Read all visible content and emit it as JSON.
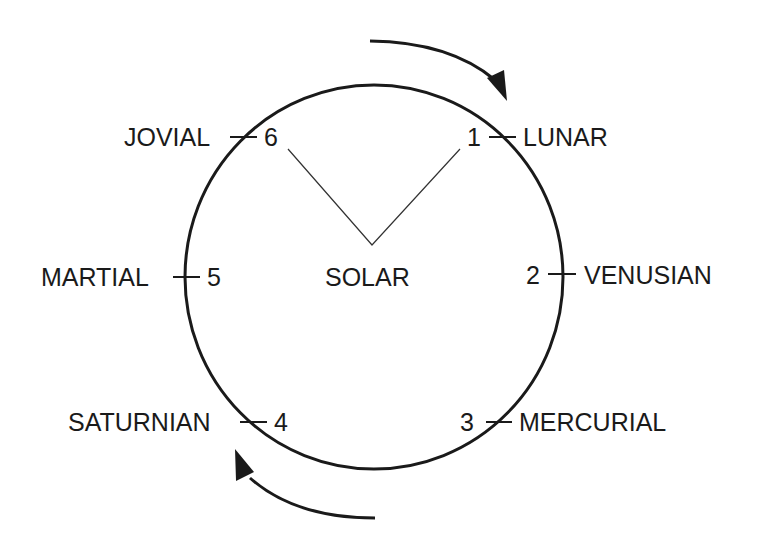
{
  "diagram": {
    "type": "planetary-cycle-circle",
    "center_label": "SOLAR",
    "colors": {
      "stroke": "#1a1a1a",
      "background": "#ffffff"
    },
    "nodes": [
      {
        "number": "1",
        "name": "LUNAR"
      },
      {
        "number": "2",
        "name": "VENUSIAN"
      },
      {
        "number": "3",
        "name": "MERCURIAL"
      },
      {
        "number": "4",
        "name": "SATURNIAN"
      },
      {
        "number": "5",
        "name": "MARTIAL"
      },
      {
        "number": "6",
        "name": "JOVIAL"
      }
    ],
    "arrows": [
      {
        "position": "top-right",
        "direction": "clockwise"
      },
      {
        "position": "bottom-left",
        "direction": "clockwise"
      }
    ],
    "connectors": [
      {
        "from": "6",
        "to": "SOLAR"
      },
      {
        "from": "SOLAR",
        "to": "1"
      }
    ]
  }
}
